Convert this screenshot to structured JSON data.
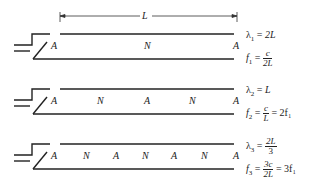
{
  "dimension": {
    "label": "L"
  },
  "tubes": [
    {
      "nodes": [
        "A",
        "N",
        "A"
      ],
      "wavelength": {
        "symbol": "λ",
        "sub": "1",
        "rhs": "2L"
      },
      "frequency": {
        "symbol": "f",
        "sub": "1",
        "num": "c",
        "den": "2L",
        "tail": ""
      }
    },
    {
      "nodes": [
        "A",
        "N",
        "A",
        "N",
        "A"
      ],
      "wavelength": {
        "symbol": "λ",
        "sub": "2",
        "rhs": "L"
      },
      "frequency": {
        "symbol": "f",
        "sub": "2",
        "num": "c",
        "den": "L",
        "tail": "= 2f₁"
      }
    },
    {
      "nodes": [
        "A",
        "N",
        "A",
        "N",
        "A",
        "N",
        "A"
      ],
      "wavelength": {
        "symbol": "λ",
        "sub": "3",
        "num": "2L",
        "den": "3"
      },
      "frequency": {
        "symbol": "f",
        "sub": "3",
        "num": "3c",
        "den": "2L",
        "tail": "= 3f₁"
      }
    }
  ]
}
